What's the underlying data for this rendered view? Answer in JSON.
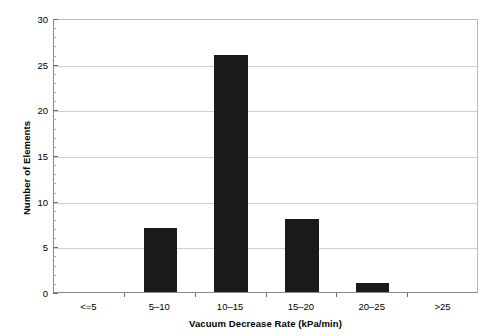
{
  "chart_data": {
    "type": "bar",
    "title": "",
    "xlabel": "Vacuum Decrease Rate (kPa/min)",
    "ylabel": "Number of Elements",
    "categories": [
      "<=5",
      "5–10",
      "10–15",
      "15–20",
      "20–25",
      ">25"
    ],
    "values": [
      0,
      7,
      26,
      8,
      1,
      0
    ],
    "ylim": [
      0,
      30
    ],
    "ytick_labels": [
      "0",
      "5",
      "10",
      "15",
      "20",
      "25",
      "30"
    ],
    "ytick_values": [
      0,
      5,
      10,
      15,
      20,
      25,
      30
    ],
    "y_minor_interval": 1,
    "grid": "horizontal",
    "legend": "none",
    "bar_color": "#1a1a1a",
    "background_color": "#ffffff",
    "gridline_color": "#cfcfcf",
    "axis_color": "#8a8a8a"
  }
}
